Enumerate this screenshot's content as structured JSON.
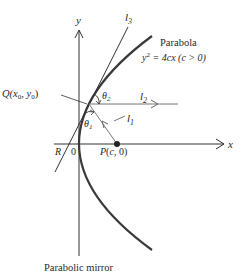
{
  "diagram": {
    "type": "parabolic-mirror-reflection",
    "axes": {
      "x_label": "x",
      "y_label": "y",
      "origin_label": "0"
    },
    "parabola": {
      "title": "Parabola",
      "equation_lhs": "y",
      "equation_exp": "2",
      "equation_rhs": " = 4cx (c > 0)"
    },
    "points": {
      "Q": {
        "name": "Q",
        "coords": "(x",
        "sub0": "0",
        "sep": ", y",
        "sub1": "0",
        "close": ")"
      },
      "P": {
        "label": "P(c, 0)"
      },
      "R": {
        "label": "R"
      }
    },
    "lines": {
      "l1": {
        "name": "l",
        "sub": "1"
      },
      "l2": {
        "name": "l",
        "sub": "2"
      },
      "l3": {
        "name": "l",
        "sub": "3"
      }
    },
    "angles": {
      "theta1": {
        "name": "θ",
        "sub": "1"
      },
      "theta2": {
        "name": "θ",
        "sub": "2"
      }
    },
    "caption": "Parabolic mirror",
    "colors": {
      "curve": "#3a3a3a",
      "axis": "#333333",
      "ray": "#555555",
      "text": "#2a2a2a"
    }
  }
}
